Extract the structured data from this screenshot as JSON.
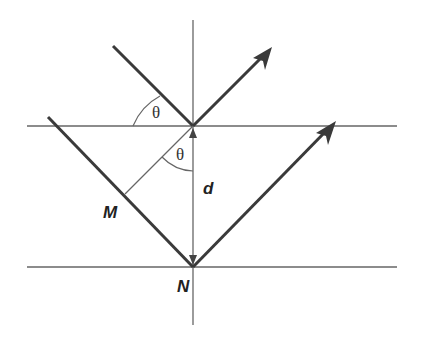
{
  "diagram": {
    "type": "thin-film reflection geometry",
    "labels": {
      "theta_top": "θ",
      "theta_inner": "θ",
      "d": "d",
      "M": "M",
      "N": "N"
    },
    "colors": {
      "line": "#555555",
      "ray": "#3a3a3a",
      "background": "#ffffff"
    },
    "elements": {
      "top_surface_y": 126,
      "bottom_surface_y": 267,
      "normal_x": 193
    }
  }
}
